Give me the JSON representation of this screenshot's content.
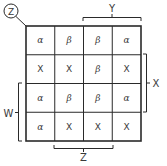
{
  "diagram": {
    "type": "karnaugh-map",
    "corner_label": "Z",
    "grid": {
      "rows": 4,
      "cols": 4,
      "cells": [
        [
          "α",
          "β",
          "β",
          "α"
        ],
        [
          "X",
          "X",
          "β",
          "X"
        ],
        [
          "α",
          "β",
          "β",
          "α"
        ],
        [
          "α",
          "X",
          "X",
          "X"
        ]
      ]
    },
    "brackets": {
      "top": {
        "label": "Y",
        "covers_columns": [
          2,
          3
        ]
      },
      "right": {
        "label": "X",
        "covers_rows": [
          1,
          2
        ]
      },
      "left": {
        "label": "W",
        "covers_rows": [
          2,
          3
        ]
      },
      "bottom": {
        "label": "Z",
        "covers_columns": [
          1,
          2
        ]
      }
    },
    "colors": {
      "line": "#2a2a2a",
      "text": "#3a3a3a",
      "background": "#ffffff"
    }
  }
}
